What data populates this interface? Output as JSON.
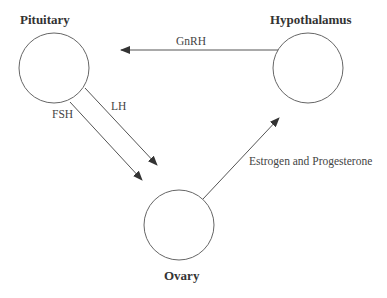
{
  "diagram": {
    "title": "",
    "nodes": [
      {
        "id": "pituitary",
        "label": "Pituitary",
        "cx": 54,
        "cy": 68,
        "r": 35
      },
      {
        "id": "hypothalamus",
        "label": "Hypothalamus",
        "cx": 308,
        "cy": 68,
        "r": 35
      },
      {
        "id": "ovary",
        "label": "Ovary",
        "cx": 179,
        "cy": 225,
        "r": 35
      }
    ],
    "edges": [
      {
        "from": "hypothalamus",
        "to": "pituitary",
        "label": "GnRH"
      },
      {
        "from": "pituitary",
        "to": "ovary",
        "label": "LH"
      },
      {
        "from": "pituitary",
        "to": "ovary",
        "label": "FSH"
      },
      {
        "from": "ovary",
        "to": "hypothalamus",
        "label": "Estrogen and Progesterone"
      }
    ],
    "colors": {
      "stroke": "#555555",
      "arrowhead": "#333333",
      "text": "#333333"
    }
  }
}
